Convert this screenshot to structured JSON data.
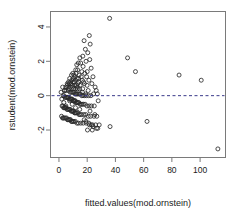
{
  "chart_data": {
    "type": "scatter",
    "title": "",
    "xlabel": "fitted.values(mod.ornstein)",
    "ylabel": "rstudent(mod.ornstein)",
    "xlim": [
      -6,
      118
    ],
    "ylim": [
      -3.6,
      4.9
    ],
    "xticks": [
      0,
      20,
      40,
      60,
      80,
      100
    ],
    "xtick_labels": [
      "0",
      "20",
      "40",
      "60",
      "80",
      "100"
    ],
    "yticks": [
      4,
      2,
      0,
      -2
    ],
    "ytick_labels": [
      "4",
      "2",
      "0",
      "-2"
    ],
    "grid": false,
    "legend": null,
    "point_marker": "open-circle",
    "point_color": "#2b2b2b",
    "frame_color": "#7a7a7a",
    "annotations": [
      {
        "kind": "horizontal-reference-line",
        "y": 0,
        "style": "dashed",
        "color": "#3a3a8a"
      }
    ],
    "series": [
      {
        "name": "rstudent vs fitted",
        "x": [
          35.9,
          21.5,
          17.8,
          22.1,
          18.7,
          20.4,
          16.9,
          14.8,
          48.6,
          21.8,
          19.2,
          13.7,
          15.4,
          12.6,
          17.1,
          22.8,
          54.2,
          11.9,
          13.2,
          16.2,
          20.0,
          18.3,
          9.8,
          12.1,
          14.3,
          10.6,
          85.1,
          8.9,
          11.3,
          15.8,
          24.1,
          19.6,
          13.9,
          100.8,
          7.6,
          10.2,
          12.8,
          16.5,
          21.2,
          9.1,
          11.7,
          14.0,
          17.4,
          6.8,
          8.3,
          10.9,
          13.4,
          18.0,
          23.3,
          5.9,
          7.2,
          9.4,
          11.1,
          12.3,
          15.0,
          19.9,
          25.6,
          4.8,
          6.3,
          8.1,
          9.7,
          10.4,
          11.8,
          13.1,
          14.6,
          16.8,
          20.7,
          26.4,
          3.9,
          5.1,
          6.6,
          7.9,
          8.7,
          9.5,
          10.1,
          10.8,
          11.5,
          12.2,
          12.9,
          13.6,
          14.4,
          15.2,
          16.1,
          17.0,
          18.1,
          19.4,
          21.0,
          22.6,
          24.5,
          27.2,
          2.9,
          3.6,
          4.3,
          5.0,
          5.6,
          6.1,
          6.7,
          7.3,
          7.8,
          8.4,
          8.9,
          9.3,
          9.9,
          10.3,
          10.7,
          11.2,
          11.6,
          12.0,
          12.5,
          13.0,
          13.5,
          14.1,
          14.9,
          15.6,
          16.4,
          17.3,
          18.5,
          19.8,
          21.4,
          23.0,
          25.0,
          27.8,
          2.2,
          2.8,
          3.3,
          3.8,
          4.2,
          4.7,
          5.2,
          5.7,
          6.2,
          6.9,
          7.5,
          8.0,
          8.6,
          9.0,
          9.6,
          10.0,
          10.5,
          11.0,
          11.4,
          11.9,
          12.4,
          13.3,
          14.2,
          15.1,
          16.0,
          17.6,
          19.0,
          20.8,
          22.4,
          24.8,
          26.8,
          1.8,
          2.5,
          3.1,
          3.7,
          4.5,
          5.4,
          6.0,
          6.5,
          7.1,
          7.7,
          8.2,
          8.8,
          9.2,
          9.8,
          10.6,
          11.6,
          12.7,
          13.8,
          15.5,
          17.2,
          19.3,
          21.6,
          23.8,
          26.0,
          28.5,
          62.4,
          36.2,
          1.5,
          2.0,
          2.6,
          3.4,
          4.0,
          4.9,
          5.8,
          6.4,
          7.0,
          7.6,
          8.5,
          9.4,
          10.2,
          11.7,
          13.0,
          14.7,
          16.6,
          18.9,
          22.0,
          25.4,
          27.5,
          112.6,
          20.2,
          23.6,
          26.6,
          24.2,
          22.9,
          21.1,
          19.1,
          17.9
        ],
        "y": [
          4.5,
          3.5,
          3.2,
          3.0,
          2.7,
          2.5,
          2.3,
          2.2,
          2.2,
          2.1,
          2.0,
          1.9,
          1.9,
          1.8,
          1.7,
          1.6,
          1.4,
          1.5,
          1.5,
          1.4,
          1.4,
          1.3,
          1.3,
          1.3,
          1.2,
          1.2,
          1.2,
          1.2,
          1.1,
          1.1,
          1.1,
          1.1,
          1.0,
          0.9,
          1.0,
          1.0,
          1.0,
          0.9,
          0.9,
          0.9,
          0.9,
          0.8,
          0.8,
          0.8,
          0.8,
          0.8,
          0.7,
          0.7,
          0.7,
          0.7,
          0.7,
          0.6,
          0.6,
          0.6,
          0.6,
          0.6,
          0.5,
          0.5,
          0.5,
          0.5,
          0.5,
          0.4,
          0.4,
          0.4,
          0.4,
          0.4,
          0.3,
          0.3,
          0.3,
          0.3,
          0.3,
          0.2,
          0.2,
          0.2,
          0.2,
          0.2,
          0.1,
          0.1,
          0.1,
          0.1,
          0.1,
          0.1,
          0.0,
          0.0,
          0.0,
          0.0,
          0.0,
          0.0,
          0.1,
          0.1,
          0.0,
          0.0,
          -0.1,
          -0.1,
          -0.1,
          -0.1,
          -0.1,
          -0.2,
          -0.2,
          -0.2,
          -0.2,
          -0.2,
          -0.3,
          -0.3,
          -0.3,
          -0.3,
          -0.3,
          -0.4,
          -0.4,
          -0.4,
          -0.4,
          -0.4,
          -0.5,
          -0.5,
          -0.5,
          -0.5,
          -0.5,
          -0.6,
          -0.6,
          -0.6,
          -0.6,
          -0.3,
          -0.6,
          -0.6,
          -0.7,
          -0.7,
          -0.7,
          -0.7,
          -0.7,
          -0.8,
          -0.8,
          -0.8,
          -0.8,
          -0.8,
          -0.9,
          -0.9,
          -0.9,
          -0.9,
          -0.9,
          -1.0,
          -1.0,
          -1.0,
          -1.0,
          -1.0,
          -1.1,
          -1.1,
          -1.1,
          -1.1,
          -1.1,
          -1.2,
          -1.2,
          -1.2,
          -1.2,
          -1.2,
          -1.3,
          -1.3,
          -1.3,
          -1.3,
          -1.3,
          -1.4,
          -1.4,
          -1.4,
          -1.4,
          -1.4,
          -1.5,
          -1.5,
          -1.5,
          -1.5,
          -1.5,
          -1.6,
          -1.6,
          -1.6,
          -1.6,
          -1.6,
          -1.7,
          -1.7,
          -1.7,
          -1.7,
          -1.5,
          -1.8,
          0.2,
          -0.2,
          0.5,
          -0.4,
          0.3,
          -0.6,
          0.6,
          -0.1,
          0.4,
          -0.3,
          0.7,
          -0.5,
          0.8,
          -0.7,
          0.5,
          -0.8,
          0.2,
          0.1,
          -0.9,
          -1.1,
          -1.9,
          -3.1,
          -2.0,
          -2.0,
          -1.9,
          -1.8,
          -1.7,
          -1.6,
          -1.5,
          -1.4
        ]
      }
    ]
  }
}
